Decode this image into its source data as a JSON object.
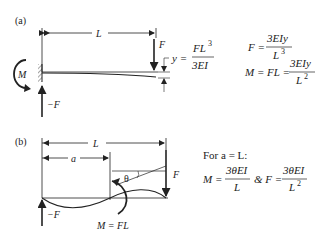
{
  "panel_a": {
    "label": "(a)",
    "length_label": "L",
    "load_label": "F",
    "reaction_label": "−F",
    "moment_label": "M",
    "deflection": {
      "lhs": "y =",
      "num": "FL",
      "num_exp": "3",
      "den": "3EI"
    },
    "equations": [
      {
        "lhs": "F =",
        "num": "3EIy",
        "den": "L",
        "den_exp": "3"
      },
      {
        "lhs": "M = FL =",
        "num": "3EIy",
        "den": "L",
        "den_exp": "2"
      }
    ]
  },
  "panel_b": {
    "label": "(b)",
    "length_label": "L",
    "a_label": "a",
    "angle_label": "θ",
    "load_label": "F",
    "reaction_label": "−F",
    "moment_label": "M = FL",
    "condition": "For a = L:",
    "equations": {
      "m_lhs": "M =",
      "m_num": "3θEI",
      "m_den": "L",
      "joiner": "& F =",
      "f_num": "3θEI",
      "f_den": "L",
      "f_den_exp": "2"
    }
  }
}
